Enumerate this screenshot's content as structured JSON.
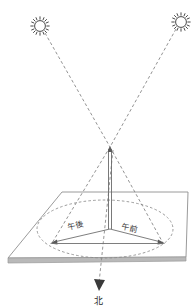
{
  "figure": {
    "background_color": "#ffffff",
    "width": 196,
    "height": 308
  },
  "labels": {
    "afternoon": "午後",
    "morning": "午前",
    "north": "北"
  },
  "icons": {
    "sun_left": "sun-icon",
    "sun_right": "sun-icon",
    "north_arrow": "arrow-down-icon"
  },
  "colors": {
    "outline": "#6b6b6b",
    "dashed": "#8a8a8a",
    "ground_edge": "#9a9a9a",
    "ground_band": "#b5b5b5",
    "text": "#333333",
    "gnomon": "#5a5a5a"
  },
  "geometry": {
    "sun_left": {
      "cx": 40,
      "cy": 26,
      "r": 6
    },
    "sun_right": {
      "cx": 181,
      "cy": 22,
      "r": 6
    },
    "gnomon_apex": {
      "x": 110,
      "y": 147
    },
    "gnomon_base": {
      "x": 110,
      "y": 229
    },
    "shadow_tip_afternoon": {
      "x": 52,
      "y": 243
    },
    "shadow_tip_morning": {
      "x": 163,
      "y": 243
    },
    "ground_plane": [
      {
        "x": 62,
        "y": 192
      },
      {
        "x": 188,
        "y": 192
      },
      {
        "x": 186,
        "y": 258
      },
      {
        "x": 8,
        "y": 259
      }
    ],
    "ellipse": {
      "cx": 105,
      "cy": 229,
      "rx": 68,
      "ry": 29
    },
    "north_arrow_tip": {
      "x": 98,
      "y": 288
    }
  },
  "annotations": {
    "ray_left_label": "morning-sun-ray",
    "ray_right_label": "afternoon-sun-ray",
    "shadow_left_label": "afternoon-shadow",
    "shadow_right_label": "morning-shadow"
  }
}
